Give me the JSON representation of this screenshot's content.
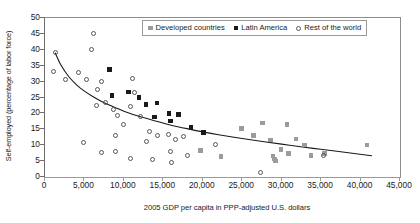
{
  "chart_data": {
    "type": "scatter",
    "title": "",
    "xlabel": "2005 GDP per capita in PPP-adjusted U.S. dollars",
    "ylabel": "Self-employed (percentage of labor force)",
    "xlim": [
      0,
      45000
    ],
    "ylim": [
      0,
      50
    ],
    "xticks": [
      0,
      5000,
      10000,
      15000,
      20000,
      25000,
      30000,
      35000,
      40000,
      45000
    ],
    "xtick_labels": [
      "0",
      "5,000",
      "10,000",
      "15,000",
      "20,000",
      "25,000",
      "30,000",
      "35,000",
      "40,000",
      "45,000"
    ],
    "yticks": [
      0,
      5,
      10,
      15,
      20,
      25,
      30,
      35,
      40,
      45,
      50
    ],
    "ytick_labels": [
      "0",
      "5",
      "10",
      "15",
      "20",
      "25",
      "30",
      "35",
      "40",
      "45",
      "50"
    ],
    "grid": false,
    "legend_position": "top-center",
    "colors": {
      "developed": "#9b9b9b",
      "latin_america": "#1a1a1a",
      "rest_of_world": "#555555",
      "trend_line": "#1a1a1a",
      "axis": "#8d8d8d"
    },
    "series": [
      {
        "name": "Developed countries",
        "marker": "filled-square-gray",
        "points": [
          [
            19700,
            8.3
          ],
          [
            22300,
            6.4
          ],
          [
            24900,
            15.3
          ],
          [
            26400,
            13.1
          ],
          [
            27600,
            17.0
          ],
          [
            28600,
            11.6
          ],
          [
            28900,
            6.6
          ],
          [
            29100,
            5.6
          ],
          [
            29200,
            5.0
          ],
          [
            29900,
            8.6
          ],
          [
            30700,
            16.6
          ],
          [
            30900,
            7.4
          ],
          [
            31800,
            12.0
          ],
          [
            32900,
            10.0
          ],
          [
            33700,
            6.7
          ],
          [
            35400,
            7.3
          ],
          [
            40800,
            10.0
          ]
        ]
      },
      {
        "name": "Latin America",
        "marker": "filled-square-black",
        "points": [
          [
            8200,
            33.8
          ],
          [
            8500,
            25.6
          ],
          [
            10600,
            26.7
          ],
          [
            11900,
            25.0
          ],
          [
            12800,
            22.8
          ],
          [
            14200,
            23.3
          ],
          [
            13900,
            18.9
          ],
          [
            15700,
            20.0
          ],
          [
            16900,
            19.6
          ],
          [
            15900,
            17.6
          ],
          [
            18500,
            15.6
          ],
          [
            20100,
            14.0
          ]
        ]
      },
      {
        "name": "Rest of the world",
        "marker": "open-circle",
        "points": [
          [
            1300,
            39.0
          ],
          [
            1100,
            33.3
          ],
          [
            2600,
            30.8
          ],
          [
            4200,
            32.9
          ],
          [
            5200,
            30.7
          ],
          [
            6200,
            45.1
          ],
          [
            5900,
            40.2
          ],
          [
            7100,
            30.0
          ],
          [
            6700,
            27.4
          ],
          [
            6500,
            22.4
          ],
          [
            7700,
            23.4
          ],
          [
            8700,
            21.2
          ],
          [
            9200,
            19.3
          ],
          [
            11100,
            31.0
          ],
          [
            11300,
            26.7
          ],
          [
            10900,
            22.2
          ],
          [
            9900,
            16.4
          ],
          [
            8900,
            13.2
          ],
          [
            12100,
            19.0
          ],
          [
            13200,
            14.3
          ],
          [
            14300,
            12.9
          ],
          [
            12900,
            11.2
          ],
          [
            15600,
            13.3
          ],
          [
            16600,
            11.7
          ],
          [
            17600,
            12.8
          ],
          [
            7200,
            7.7
          ],
          [
            8900,
            7.9
          ],
          [
            10900,
            5.7
          ],
          [
            13600,
            5.4
          ],
          [
            15900,
            7.9
          ],
          [
            16000,
            4.6
          ],
          [
            18100,
            6.8
          ],
          [
            21600,
            10.3
          ],
          [
            27300,
            1.4
          ],
          [
            35300,
            6.9
          ],
          [
            4900,
            10.9
          ]
        ]
      }
    ],
    "trend_line": {
      "name": "fitted trend",
      "points": [
        [
          1300,
          39.0
        ],
        [
          2000,
          35.3
        ],
        [
          3000,
          31.6
        ],
        [
          4000,
          29.0
        ],
        [
          5000,
          27.0
        ],
        [
          6000,
          25.4
        ],
        [
          7000,
          24.0
        ],
        [
          8000,
          22.8
        ],
        [
          9000,
          21.7
        ],
        [
          10000,
          20.7
        ],
        [
          12000,
          19.0
        ],
        [
          14000,
          17.6
        ],
        [
          16000,
          16.3
        ],
        [
          18000,
          15.2
        ],
        [
          20000,
          14.2
        ],
        [
          22000,
          13.3
        ],
        [
          25000,
          12.1
        ],
        [
          28000,
          11.0
        ],
        [
          31000,
          10.0
        ],
        [
          34000,
          9.0
        ],
        [
          37000,
          8.1
        ],
        [
          41400,
          6.7
        ]
      ]
    }
  },
  "legend": {
    "items": [
      {
        "label": "Developed countries",
        "marker": "filled-square-gray"
      },
      {
        "label": "Latin America",
        "marker": "filled-square-black"
      },
      {
        "label": "Rest of the world",
        "marker": "open-circle"
      }
    ]
  }
}
